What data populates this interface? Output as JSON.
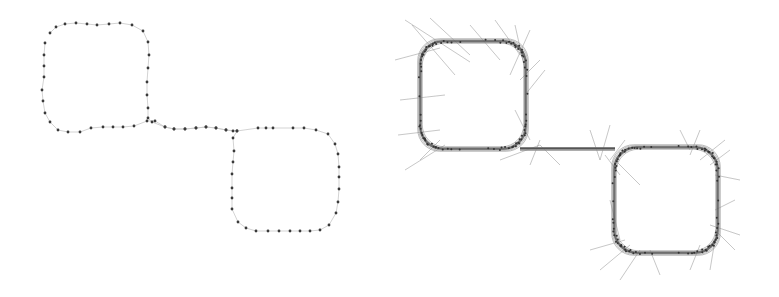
{
  "figure": {
    "left_panel": {
      "description": "Sampled points along a closed S-shaped path of two rounded squares",
      "point_color": "#3a3a3a",
      "path_color": "#c8c8c8",
      "points": [
        [
          50,
          33
        ],
        [
          56,
          27
        ],
        [
          65,
          24
        ],
        [
          76,
          23
        ],
        [
          87,
          24
        ],
        [
          97,
          25
        ],
        [
          109,
          24
        ],
        [
          120,
          23
        ],
        [
          132,
          25
        ],
        [
          143,
          31
        ],
        [
          148,
          42
        ],
        [
          149,
          55
        ],
        [
          148,
          68
        ],
        [
          147,
          82
        ],
        [
          147,
          95
        ],
        [
          148,
          108
        ],
        [
          148,
          118
        ],
        [
          152,
          122
        ],
        [
          165,
          127
        ],
        [
          174,
          129
        ],
        [
          185,
          129
        ],
        [
          196,
          128
        ],
        [
          206,
          127
        ],
        [
          216,
          128
        ],
        [
          226,
          130
        ],
        [
          233,
          131
        ],
        [
          237,
          131
        ],
        [
          258,
          128
        ],
        [
          266,
          128
        ],
        [
          273,
          128
        ],
        [
          293,
          128
        ],
        [
          304,
          128
        ],
        [
          316,
          130
        ],
        [
          328,
          134
        ],
        [
          335,
          144
        ],
        [
          338,
          154
        ],
        [
          339,
          167
        ],
        [
          339,
          177
        ],
        [
          339,
          189
        ],
        [
          338,
          202
        ],
        [
          336,
          213
        ],
        [
          329,
          225
        ],
        [
          320,
          230
        ],
        [
          310,
          231
        ],
        [
          300,
          231
        ],
        [
          290,
          231
        ],
        [
          279,
          231
        ],
        [
          268,
          231
        ],
        [
          256,
          231
        ],
        [
          246,
          228
        ],
        [
          238,
          222
        ],
        [
          232,
          209
        ],
        [
          232,
          198
        ],
        [
          232,
          188
        ],
        [
          232,
          174
        ],
        [
          233,
          162
        ],
        [
          234,
          151
        ],
        [
          233,
          138
        ],
        [
          237,
          131
        ],
        [
          226,
          130
        ],
        [
          216,
          128
        ],
        [
          206,
          127
        ],
        [
          196,
          128
        ],
        [
          185,
          129
        ],
        [
          174,
          129
        ],
        [
          165,
          127
        ],
        [
          155,
          121
        ],
        [
          147,
          121
        ],
        [
          134,
          126
        ],
        [
          123,
          127
        ],
        [
          113,
          127
        ],
        [
          103,
          127
        ],
        [
          91,
          128
        ],
        [
          80,
          132
        ],
        [
          68,
          132
        ],
        [
          58,
          130
        ],
        [
          50,
          122
        ],
        [
          45,
          113
        ],
        [
          43,
          101
        ],
        [
          42,
          90
        ],
        [
          44,
          77
        ],
        [
          44,
          66
        ],
        [
          44,
          55
        ],
        [
          45,
          43
        ]
      ]
    },
    "right_panel": {
      "description": "Dense trace of the same S-shaped path with radiating tangent/normal line segments",
      "stroke_color": "#555555",
      "ray_color": "#8a8a8a",
      "fill_color": "#d9d9d9",
      "offset_x": 380,
      "path": "M420,45 C424,36 434,38 450,40 L500,42 C516,43 524,55 525,70 L526,130 C527,142 535,148 550,149 L600,150 C612,150 615,158 614,170 L614,232 C615,245 625,252 640,252 L695,252 C712,251 718,240 718,225 L718,170 C717,155 708,147 690,147 L600,150 L550,149 C540,149 430,149 428,148 C420,145 420,135 420,120 Z",
      "loops": [
        {
          "cx": 473,
          "cy": 95,
          "half_w": 53,
          "half_h": 54
        },
        {
          "cx": 666,
          "cy": 200,
          "half_w": 52,
          "half_h": 53
        }
      ],
      "rays": [
        [
          405,
          20,
          470,
          62
        ],
        [
          412,
          25,
          455,
          75
        ],
        [
          430,
          18,
          470,
          55
        ],
        [
          395,
          60,
          440,
          48
        ],
        [
          400,
          100,
          445,
          95
        ],
        [
          398,
          135,
          440,
          130
        ],
        [
          405,
          170,
          445,
          145
        ],
        [
          420,
          160,
          440,
          140
        ],
        [
          470,
          25,
          500,
          60
        ],
        [
          495,
          20,
          520,
          55
        ],
        [
          515,
          25,
          525,
          70
        ],
        [
          530,
          30,
          510,
          75
        ],
        [
          540,
          60,
          520,
          80
        ],
        [
          545,
          70,
          525,
          95
        ],
        [
          515,
          110,
          530,
          140
        ],
        [
          500,
          160,
          540,
          145
        ],
        [
          530,
          165,
          540,
          140
        ],
        [
          560,
          165,
          540,
          145
        ],
        [
          590,
          130,
          600,
          160
        ],
        [
          610,
          125,
          600,
          160
        ],
        [
          625,
          140,
          610,
          160
        ],
        [
          620,
          175,
          605,
          155
        ],
        [
          640,
          185,
          615,
          160
        ],
        [
          610,
          200,
          620,
          240
        ],
        [
          590,
          250,
          625,
          240
        ],
        [
          600,
          270,
          630,
          245
        ],
        [
          620,
          280,
          640,
          250
        ],
        [
          660,
          275,
          650,
          250
        ],
        [
          690,
          270,
          700,
          245
        ],
        [
          710,
          270,
          715,
          240
        ],
        [
          735,
          250,
          715,
          230
        ],
        [
          740,
          235,
          710,
          225
        ],
        [
          735,
          200,
          715,
          210
        ],
        [
          740,
          180,
          715,
          175
        ],
        [
          730,
          150,
          710,
          165
        ],
        [
          725,
          140,
          700,
          160
        ],
        [
          700,
          130,
          690,
          155
        ],
        [
          680,
          130,
          690,
          150
        ]
      ]
    }
  }
}
